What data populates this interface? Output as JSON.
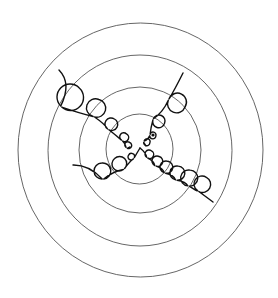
{
  "figure": {
    "width": 278,
    "height": 298,
    "background": "#ffffff",
    "ring_color": "#555555",
    "strand_color": "#111111"
  },
  "rings": [
    {
      "name": "ring-outer",
      "cx": 140.5,
      "cy": 150,
      "rx": 122.5,
      "ry": 127
    },
    {
      "name": "ring-second",
      "cx": 140,
      "cy": 150.5,
      "rx": 92,
      "ry": 95.5
    },
    {
      "name": "ring-third",
      "cx": 140,
      "cy": 150,
      "rx": 61,
      "ry": 63
    },
    {
      "name": "ring-inner",
      "cx": 139.5,
      "cy": 149,
      "rx": 33.5,
      "ry": 35
    }
  ],
  "strands": [
    {
      "name": "strand-top-left",
      "start": [
        59,
        70
      ],
      "end": [
        130,
        147
      ],
      "loops": [
        {
          "cx": 70,
          "cy": 97,
          "r": 13
        },
        {
          "cx": 96,
          "cy": 108,
          "r": 9
        },
        {
          "cx": 111,
          "cy": 124,
          "r": 6
        },
        {
          "cx": 124,
          "cy": 137,
          "r": 4
        },
        {
          "cx": 128,
          "cy": 145,
          "r": 3
        }
      ]
    },
    {
      "name": "strand-top-right",
      "start": [
        183,
        73
      ],
      "end": [
        146,
        146
      ],
      "loops": [
        {
          "cx": 177,
          "cy": 103,
          "r": 9
        },
        {
          "cx": 159,
          "cy": 121,
          "r": 6
        },
        {
          "cx": 153,
          "cy": 135,
          "r": 3
        },
        {
          "cx": 147,
          "cy": 142,
          "r": 3
        }
      ]
    },
    {
      "name": "strand-bottom-left",
      "start": [
        73,
        165
      ],
      "end": [
        140,
        148
      ],
      "loops": [
        {
          "cx": 102,
          "cy": 171,
          "r": 8
        },
        {
          "cx": 119,
          "cy": 164,
          "r": 7
        },
        {
          "cx": 131,
          "cy": 157,
          "r": 3
        }
      ]
    },
    {
      "name": "strand-bottom-right",
      "start": [
        140,
        148
      ],
      "end": [
        213,
        202
      ],
      "loops": [
        {
          "cx": 149,
          "cy": 154,
          "r": 4
        },
        {
          "cx": 157,
          "cy": 161,
          "r": 5
        },
        {
          "cx": 166,
          "cy": 167,
          "r": 6
        },
        {
          "cx": 177,
          "cy": 173,
          "r": 7
        },
        {
          "cx": 189,
          "cy": 178,
          "r": 8
        },
        {
          "cx": 202,
          "cy": 184,
          "r": 8
        }
      ]
    }
  ],
  "markers": [
    {
      "name": "vertex-dot",
      "cx": 153,
      "cy": 135,
      "r": 1.6
    }
  ]
}
